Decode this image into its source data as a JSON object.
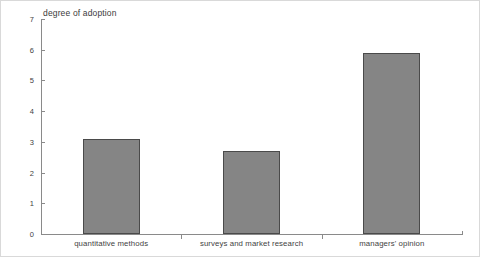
{
  "chart_data": {
    "type": "bar",
    "title": "degree of adoption",
    "xlabel": "",
    "ylabel": "",
    "categories": [
      "quantitative methods",
      "surveys and market research",
      "managers' opinion"
    ],
    "values": [
      3.1,
      2.7,
      5.9
    ],
    "ylim": [
      0,
      7
    ],
    "yticks": [
      "0",
      "1",
      "2",
      "3",
      "4",
      "5",
      "6",
      "7"
    ],
    "grid": false,
    "legend": null,
    "bar_color": "#858585",
    "bar_edge_color": "#4a4a4a",
    "axis_color": "#8a8a8a",
    "text_color": "#3f3f3f",
    "background": "#ffffff"
  }
}
